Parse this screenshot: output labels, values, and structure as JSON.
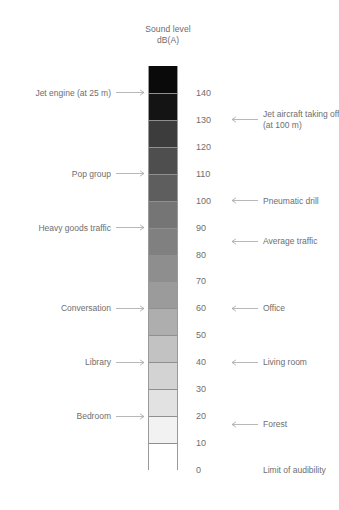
{
  "title": {
    "line1": "Sound level",
    "line2": "dB(A)"
  },
  "chart_data": {
    "type": "bar",
    "ylabel": "dB(A)",
    "xlabel": "",
    "ylim": [
      0,
      150
    ],
    "orientation": "vertical",
    "grid": false,
    "legend": "none",
    "tick_labels": [
      "140",
      "130",
      "120",
      "110",
      "100",
      "90",
      "80",
      "70",
      "60",
      "50",
      "40",
      "30",
      "20",
      "10",
      "0"
    ],
    "tick_values": [
      140,
      130,
      120,
      110,
      100,
      90,
      80,
      70,
      60,
      50,
      40,
      30,
      20,
      10,
      0
    ],
    "bands": [
      {
        "range": [
          140,
          150
        ],
        "label": "140",
        "color": "#0a0a0a"
      },
      {
        "range": [
          130,
          140
        ],
        "label": "130",
        "color": "#141414"
      },
      {
        "range": [
          120,
          130
        ],
        "label": "120",
        "color": "#3c3c3c"
      },
      {
        "range": [
          110,
          120
        ],
        "label": "110",
        "color": "#4e4e4e"
      },
      {
        "range": [
          100,
          110
        ],
        "label": "100",
        "color": "#5e5e5e"
      },
      {
        "range": [
          90,
          100
        ],
        "label": "90",
        "color": "#757575"
      },
      {
        "range": [
          80,
          90
        ],
        "label": "80",
        "color": "#808080"
      },
      {
        "range": [
          70,
          80
        ],
        "label": "70",
        "color": "#8e8e8e"
      },
      {
        "range": [
          60,
          70
        ],
        "label": "60",
        "color": "#9b9b9b"
      },
      {
        "range": [
          50,
          60
        ],
        "label": "50",
        "color": "#aeaeae"
      },
      {
        "range": [
          40,
          50
        ],
        "label": "40",
        "color": "#c2c2c2"
      },
      {
        "range": [
          30,
          40
        ],
        "label": "30",
        "color": "#d3d3d3"
      },
      {
        "range": [
          20,
          30
        ],
        "label": "20",
        "color": "#e2e2e2"
      },
      {
        "range": [
          10,
          20
        ],
        "label": "10",
        "color": "#f2f2f2"
      },
      {
        "range": [
          0,
          10
        ],
        "label": "0",
        "color": "#ffffff"
      }
    ],
    "annotations_left": [
      {
        "text": "Jet engine (at 25 m)",
        "value": 140
      },
      {
        "text": "Pop group",
        "value": 110
      },
      {
        "text": "Heavy goods traffic",
        "value": 90
      },
      {
        "text": "Conversation",
        "value": 60
      },
      {
        "text": "Library",
        "value": 40
      },
      {
        "text": "Bedroom",
        "value": 20
      }
    ],
    "annotations_right": [
      {
        "text": "Jet aircraft taking off\n(at 100 m)",
        "value": 130,
        "arrow": true
      },
      {
        "text": "Pneumatic drill",
        "value": 100,
        "arrow": true
      },
      {
        "text": "Average traffic",
        "value": 85,
        "arrow": true
      },
      {
        "text": "Office",
        "value": 60,
        "arrow": true
      },
      {
        "text": "Living room",
        "value": 40,
        "arrow": true
      },
      {
        "text": "Forest",
        "value": 17,
        "arrow": true
      },
      {
        "text": "Limit of audibility",
        "value": 0,
        "arrow": false
      }
    ]
  },
  "colors": {
    "text": "#6e6e6e",
    "arrow": "#b0b0b0",
    "border": "#9a9a9a"
  }
}
